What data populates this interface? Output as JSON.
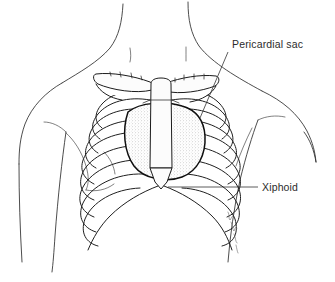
{
  "figure": {
    "background_color": "#ffffff",
    "ink_color": "#1f1f1f",
    "text_color": "#2b2b2b",
    "shade_color": "#b9b9b9",
    "width": 335,
    "height": 282
  },
  "labels": [
    {
      "id": "pericardial-sac",
      "text": "Pericardial sac",
      "text_x": 232,
      "text_y": 48,
      "leader": {
        "x1": 228,
        "y1": 52,
        "x2": 200,
        "y2": 118,
        "style": "diagonal"
      }
    },
    {
      "id": "xiphoid",
      "text": "Xiphoid",
      "text_x": 262,
      "text_y": 191,
      "leader": {
        "x1": 258,
        "y1": 187,
        "x2": 168,
        "y2": 187,
        "style": "horizontal"
      }
    }
  ],
  "anatomy": {
    "parts": [
      "neck",
      "left-shoulder",
      "right-shoulder",
      "left-arm",
      "right-arm",
      "left-clavicle",
      "right-clavicle",
      "sternum-manubrium",
      "sternum-body",
      "xiphoid-process",
      "left-rib-cage",
      "right-rib-cage",
      "costal-margin",
      "pericardial-sac-outline",
      "pericardial-sac-shading",
      "left-breast-contour",
      "right-breast-contour",
      "artist-signature"
    ],
    "rib_pair_count": 9
  }
}
